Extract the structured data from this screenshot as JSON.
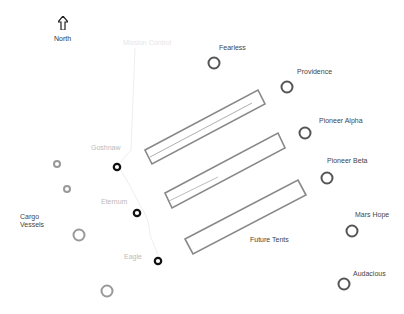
{
  "compass": {
    "label": "North",
    "icon": "north-arrow-icon"
  },
  "path_label": "Mission Control",
  "colors": {
    "outline": "#888888",
    "site_ring": "#555555",
    "active_ring": "#111111",
    "faint_ring": "#999999",
    "trail": "#eeeeee"
  },
  "sites_right": [
    {
      "name": "Fearless",
      "x": 214,
      "y": 63
    },
    {
      "name": "Providence",
      "x": 287,
      "y": 87
    },
    {
      "name": "Pioneer Alpha",
      "x": 305,
      "y": 133
    },
    {
      "name": "Pioneer Beta",
      "x": 327,
      "y": 178
    },
    {
      "name": "Mars Hope",
      "x": 352,
      "y": 231
    },
    {
      "name": "Audacious",
      "x": 344,
      "y": 284
    }
  ],
  "sites_left": [
    {
      "name": "Goshnaw",
      "x": 117,
      "y": 167
    },
    {
      "name": "Eternum",
      "x": 137,
      "y": 213
    },
    {
      "name": "Eagle",
      "x": 158,
      "y": 261
    }
  ],
  "cargo": {
    "label_line1": "Cargo",
    "label_line2": "Vessels"
  },
  "tent_area_label": "Future Tents"
}
